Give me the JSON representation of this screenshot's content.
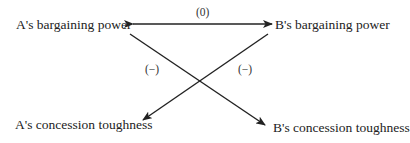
{
  "diagram": {
    "nodes": {
      "a_power": "A's bargaining power",
      "b_power": "B's bargaining power",
      "a_toughness": "A's concession toughness",
      "b_toughness": "B's concession toughness"
    },
    "edges": [
      {
        "from": "A's bargaining power",
        "to": "B's bargaining power",
        "label": "(0)",
        "bidirectional": true
      },
      {
        "from": "A's bargaining power",
        "to": "B's concession toughness",
        "label": "(−)"
      },
      {
        "from": "B's bargaining power",
        "to": "A's concession toughness",
        "label": "(−)"
      }
    ],
    "labels": {
      "horizontal": "(0)",
      "left_cross": "(−)",
      "right_cross": "(−)"
    },
    "colors": {
      "line": "#222222",
      "text": "#222222"
    }
  }
}
